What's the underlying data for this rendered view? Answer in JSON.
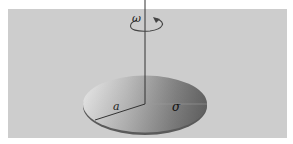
{
  "diagram": {
    "labels": {
      "omega": "ω",
      "radius": "a",
      "sigma": "σ"
    },
    "colors": {
      "background_panel": "#cfcfcf",
      "border": "#ffffff",
      "axis": "#333333",
      "disk_light": "#f4f4f4",
      "disk_dark": "#6e6e6e"
    }
  }
}
